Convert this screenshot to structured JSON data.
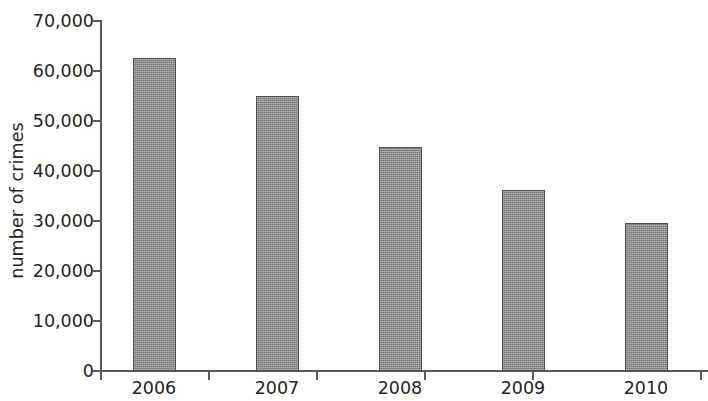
{
  "chart_data": {
    "type": "bar",
    "title": "",
    "subtitle": "",
    "xlabel": "",
    "ylabel": "number of crimes",
    "categories": [
      "2006",
      "2007",
      "2008",
      "2009",
      "2010"
    ],
    "values": [
      62500,
      54800,
      44700,
      36000,
      29600
    ],
    "series": [
      {
        "name": "number of crimes",
        "values": [
          62500,
          54800,
          44700,
          36000,
          29600
        ]
      }
    ],
    "ylim": [
      0,
      70000
    ],
    "ytick_values": [
      0,
      10000,
      20000,
      30000,
      40000,
      50000,
      60000,
      70000
    ],
    "ytick_labels": [
      "0",
      "10,000",
      "20,000",
      "30,000",
      "40,000",
      "50,000",
      "60,000",
      "70,000"
    ],
    "grid": false,
    "legend": false,
    "legend_position": "none",
    "bar_fill_color": "#949494",
    "bar_border_color": "#4d4d4d",
    "axis_color": "#58595b",
    "text_color": "#231f20",
    "background_color": "#ffffff"
  }
}
